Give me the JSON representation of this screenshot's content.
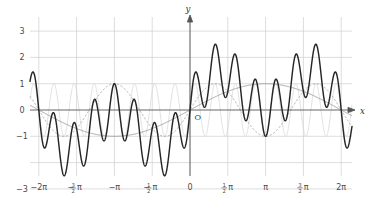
{
  "chart_data": {
    "type": "line",
    "title": "",
    "xlabel": "x",
    "ylabel": "y",
    "origin_label": "O",
    "grid": true,
    "legend": "none",
    "xlim": [
      -6.8068,
      7.1209
    ],
    "ylim": [
      -3.45,
      3.45
    ],
    "x_ticks": [
      {
        "value": -6.2832,
        "label": "−2π"
      },
      {
        "value": -4.7124,
        "label": "−³⁄₂π",
        "num": "3",
        "den": "2",
        "sign": "−",
        "pi": "π"
      },
      {
        "value": -3.1416,
        "label": "−π"
      },
      {
        "value": -1.5708,
        "label": "−¹⁄₂π",
        "num": "1",
        "den": "2",
        "sign": "−",
        "pi": "π"
      },
      {
        "value": 0.0,
        "label": "0"
      },
      {
        "value": 1.5708,
        "label": "¹⁄₂π",
        "num": "1",
        "den": "2",
        "sign": "",
        "pi": "π"
      },
      {
        "value": 3.1416,
        "label": "π"
      },
      {
        "value": 4.7124,
        "label": "³⁄₂π",
        "num": "3",
        "den": "2",
        "sign": "",
        "pi": "π"
      },
      {
        "value": 6.2832,
        "label": "2π"
      }
    ],
    "y_ticks": [
      {
        "value": 3,
        "label": "3"
      },
      {
        "value": 2,
        "label": "2"
      },
      {
        "value": 1,
        "label": "1"
      },
      {
        "value": 0,
        "label": "0"
      },
      {
        "value": -1,
        "label": "−1"
      },
      {
        "value": -2,
        "label": ""
      },
      {
        "value": -3,
        "label": "−3"
      }
    ],
    "series": [
      {
        "name": "slow-sine",
        "style": "solid-gray",
        "color": "#8c8c8c",
        "amplitude": 1,
        "frequency": 0.5,
        "phase": 0
      },
      {
        "name": "mid-sine-dashed",
        "style": "dashed-gray",
        "color": "#9a9a9a",
        "amplitude": 1,
        "frequency": 1.5,
        "phase": 0
      },
      {
        "name": "fast-sine",
        "style": "solid-light-gray",
        "color": "#d6d6d6",
        "amplitude": 1,
        "frequency": 7.5,
        "phase": 0
      },
      {
        "name": "sum-curve",
        "style": "thick-dark",
        "color": "#262626",
        "amplitude": 3,
        "frequency": 0,
        "phase": 0,
        "description": "sum of the three sine components"
      }
    ]
  }
}
